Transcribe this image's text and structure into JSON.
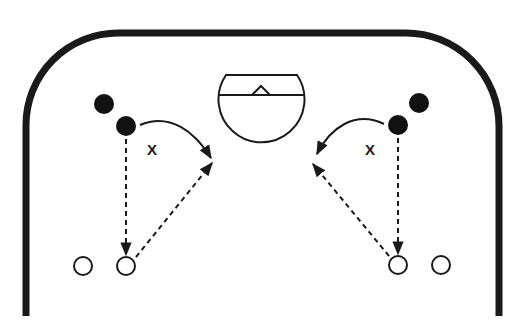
{
  "diagram": {
    "type": "basketball-half-court-drill",
    "colors": {
      "line": "#1a1a1a",
      "background": "#ffffff",
      "offense_filled": "#111111",
      "open_marker": "#ffffff"
    },
    "labels": {
      "left_x": "X",
      "right_x": "X"
    },
    "elements": {
      "court_boundary": "half-court outline with rounded corners",
      "hoop": "backboard and rim shown as circle with chord and triangle",
      "left_side": {
        "filled_players": 2,
        "open_spots": 2,
        "cut_path": "curved solid arrow toward lane",
        "dashed_paths": [
          "vertical dashed arrow down to corner spot",
          "diagonal dashed arrow from corner spot toward lane"
        ]
      },
      "right_side": {
        "filled_players": 2,
        "open_spots": 2,
        "cut_path": "curved solid arrow toward lane",
        "dashed_paths": [
          "vertical dashed arrow down to corner spot",
          "diagonal dashed arrow from corner spot toward lane"
        ]
      }
    }
  }
}
